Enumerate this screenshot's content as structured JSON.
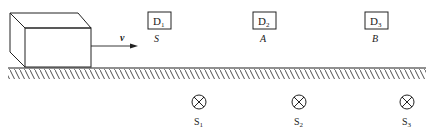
{
  "diagram": {
    "block": {
      "label": "block",
      "velocity_label": "v"
    },
    "detectors": [
      {
        "name": "D",
        "sub": "1",
        "position_label": "S"
      },
      {
        "name": "D",
        "sub": "2",
        "position_label": "A"
      },
      {
        "name": "D",
        "sub": "3",
        "position_label": "B"
      }
    ],
    "sources": [
      {
        "name": "S",
        "sub": "1"
      },
      {
        "name": "S",
        "sub": "2"
      },
      {
        "name": "S",
        "sub": "3"
      }
    ],
    "colors": {
      "ink": "#222222",
      "background": "#ffffff"
    }
  }
}
